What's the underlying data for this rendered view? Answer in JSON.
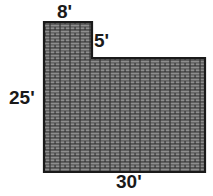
{
  "diagram": {
    "shape_type": "notched-rectangle",
    "fill_pattern": "brick-hatch",
    "colors": {
      "background": "#ffffff",
      "outline": "#1a1a1a",
      "brick_face": "#8a8a8a",
      "brick_mortar": "#2b2b2b",
      "label_text": "#1a1a1a"
    },
    "units": "feet",
    "labels": {
      "top": "8'",
      "notch": "5'",
      "left": "25'",
      "bottom": "30'"
    },
    "dimensions": {
      "overall_width": 30,
      "overall_height": 25,
      "notch_width": 8,
      "notch_depth": 5
    },
    "geometry": {
      "outer_left": 44,
      "outer_top": 22,
      "outer_right": 205,
      "outer_bottom": 172,
      "step_x": 92,
      "step_y": 58,
      "path": "M 44 22 L 92 22 L 92 58 L 205 58 L 205 172 L 44 172 Z"
    }
  }
}
